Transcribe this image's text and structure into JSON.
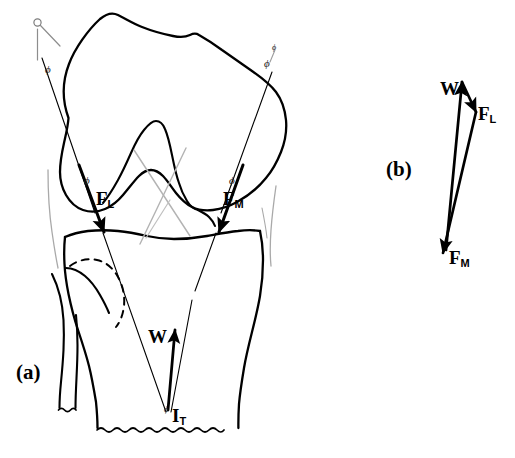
{
  "figure": {
    "background_color": "#ffffff",
    "ink_color": "#000000",
    "faint_ink_color": "#9a9a9a"
  },
  "panels": [
    {
      "id": "a",
      "label": "(a)",
      "description": "Frontal view of knee joint: femur, tibia and fibula with tibiofemoral contact force vectors"
    },
    {
      "id": "b",
      "label": "(b)",
      "description": "Closed force triangle of W, F_L and F_M"
    }
  ],
  "panel_a": {
    "label": "(a)",
    "vectors": [
      {
        "name": "F_L",
        "letter": "F",
        "sub": "L",
        "description": "lateral compartment contact force"
      },
      {
        "name": "F_M",
        "letter": "F",
        "sub": "M",
        "description": "medial compartment contact force"
      },
      {
        "name": "W",
        "letter": "W",
        "sub": "",
        "description": "body weight reaction"
      },
      {
        "name": "I_T",
        "letter": "I",
        "sub": "T",
        "description": "intersection / resultant point at tibia"
      }
    ],
    "angles": [
      {
        "name": "phi-top-left",
        "symbol": "ϕ"
      },
      {
        "name": "phi-top-right",
        "symbol": "ϕ"
      },
      {
        "name": "phi-mid-left",
        "symbol": "ϕ"
      },
      {
        "name": "phi-mid-right",
        "symbol": "ϕ"
      },
      {
        "name": "phi-bottom",
        "symbol": "ϕ"
      },
      {
        "name": "phi-upper-right-tick",
        "symbol": "ϕ"
      }
    ]
  },
  "panel_b": {
    "label": "(b)",
    "vectors": [
      {
        "name": "W",
        "letter": "W",
        "sub": ""
      },
      {
        "name": "F_L",
        "letter": "F",
        "sub": "L"
      },
      {
        "name": "F_M",
        "letter": "F",
        "sub": "M"
      }
    ]
  },
  "labels": {
    "panel_a": "(a)",
    "panel_b": "(b)",
    "FL_letter": "F",
    "FL_sub": "L",
    "FM_letter": "F",
    "FM_sub": "M",
    "W_letter": "W",
    "IT_letter": "I",
    "IT_sub": "T",
    "phi": "ϕ"
  }
}
